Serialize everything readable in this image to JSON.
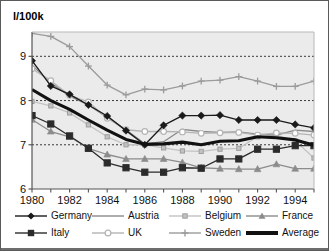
{
  "chart_data": {
    "type": "line",
    "title": "",
    "ylabel": "l/100k",
    "xlabel": "",
    "x": [
      1980,
      1981,
      1982,
      1983,
      1984,
      1985,
      1986,
      1987,
      1988,
      1989,
      1990,
      1991,
      1992,
      1993,
      1994,
      1995
    ],
    "tick_labels_x": [
      "1980",
      "1982",
      "1984",
      "1986",
      "1988",
      "1990",
      "1992",
      "1994"
    ],
    "tick_labels_y": [
      "6",
      "7",
      "8",
      "9"
    ],
    "ylim": [
      6,
      9.55
    ],
    "xlim": [
      1980,
      1995
    ],
    "grid": "horizontal-dotted",
    "legend_position": "bottom",
    "series": [
      {
        "name": "Germany",
        "color": "#1a1a1a",
        "marker": "diamond",
        "values": [
          8.9,
          8.33,
          8.14,
          7.9,
          7.65,
          7.32,
          7.0,
          7.44,
          7.66,
          7.66,
          7.67,
          7.56,
          7.56,
          7.56,
          7.46,
          7.38
        ]
      },
      {
        "name": "Italy",
        "color": "#2b2b2b",
        "marker": "square",
        "values": [
          7.66,
          7.47,
          7.2,
          6.92,
          6.59,
          6.48,
          6.38,
          6.38,
          6.48,
          6.47,
          6.68,
          6.68,
          6.9,
          6.9,
          6.98,
          6.98
        ]
      },
      {
        "name": "Austria",
        "color": "#8a8a8a",
        "marker": "none",
        "values": [
          8.8,
          8.4,
          8.1,
          7.9,
          7.62,
          7.34,
          7.02,
          7.07,
          7.35,
          7.3,
          7.28,
          7.29,
          7.24,
          7.22,
          7.33,
          7.3
        ]
      },
      {
        "name": "UK",
        "color": "#b4b4b4",
        "marker": "circle-open",
        "values": [
          8.72,
          8.45,
          8.12,
          7.97,
          7.6,
          7.34,
          7.3,
          7.3,
          7.29,
          7.26,
          7.27,
          7.28,
          7.22,
          7.27,
          7.26,
          7.22
        ]
      },
      {
        "name": "Belgium",
        "color": "#c2c2c2",
        "marker": "square-small",
        "values": [
          7.98,
          7.88,
          7.72,
          7.45,
          7.18,
          7.0,
          7.0,
          6.93,
          6.86,
          6.85,
          6.9,
          6.92,
          7.18,
          7.22,
          7.09,
          6.7
        ]
      },
      {
        "name": "Sweden",
        "color": "#9b9b9b",
        "marker": "plus",
        "values": [
          9.52,
          9.45,
          9.22,
          8.78,
          8.35,
          8.13,
          8.26,
          8.24,
          8.33,
          8.44,
          8.46,
          8.54,
          8.44,
          8.32,
          8.32,
          8.44
        ]
      },
      {
        "name": "France",
        "color": "#8c8c8c",
        "marker": "triangle",
        "values": [
          7.57,
          7.3,
          7.18,
          6.92,
          6.78,
          6.68,
          6.68,
          6.68,
          6.6,
          6.48,
          6.46,
          6.45,
          6.45,
          6.56,
          6.46,
          6.46
        ]
      },
      {
        "name": "Average",
        "color": "#111111",
        "marker": "none",
        "values": [
          8.25,
          8.0,
          7.8,
          7.56,
          7.33,
          7.12,
          7.01,
          7.02,
          7.06,
          7.0,
          7.08,
          7.09,
          7.18,
          7.16,
          7.11,
          6.99
        ]
      }
    ]
  },
  "legend": {
    "row1": [
      {
        "label": "Germany",
        "key": "germany"
      },
      {
        "label": "Austria",
        "key": "austria"
      },
      {
        "label": "Belgium",
        "key": "belgium"
      },
      {
        "label": "France",
        "key": "france"
      }
    ],
    "row2": [
      {
        "label": "Italy",
        "key": "italy"
      },
      {
        "label": "UK",
        "key": "uk"
      },
      {
        "label": "Sweden",
        "key": "sweden"
      },
      {
        "label": "Average",
        "key": "average"
      }
    ]
  },
  "colors": {
    "plot_bg": "#ebebeb",
    "frame": "#5a5a5a",
    "grid": "#3a3a3a",
    "axis": "#555555"
  }
}
